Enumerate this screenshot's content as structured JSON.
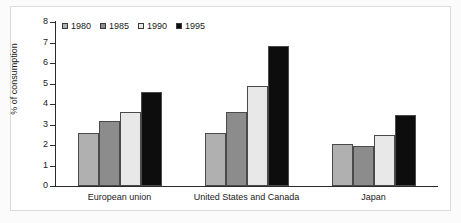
{
  "chart_data": {
    "type": "bar",
    "title": "",
    "xlabel": "",
    "ylabel": "% of consumption",
    "ylim": [
      0,
      8
    ],
    "yticks": [
      0,
      1,
      2,
      3,
      4,
      5,
      6,
      7,
      8
    ],
    "grid": false,
    "legend_position": "top-left",
    "categories": [
      "European union",
      "United States and Canada",
      "Japan"
    ],
    "series": [
      {
        "name": "1980",
        "color": "#b0b0b0",
        "values": [
          2.6,
          2.6,
          2.05
        ]
      },
      {
        "name": "1985",
        "color": "#8c8c8c",
        "values": [
          3.15,
          3.6,
          1.95
        ]
      },
      {
        "name": "1990",
        "color": "#e8e8e8",
        "values": [
          3.6,
          4.9,
          2.5
        ]
      },
      {
        "name": "1995",
        "color": "#0d0d0d",
        "values": [
          4.6,
          6.85,
          3.45
        ]
      }
    ]
  },
  "axis": {
    "tick_labels": [
      "8",
      "7",
      "6",
      "5",
      "4",
      "3",
      "2",
      "1",
      "0"
    ]
  },
  "legend": {
    "items": [
      {
        "label": "1980"
      },
      {
        "label": "1985"
      },
      {
        "label": "1990"
      },
      {
        "label": "1995"
      }
    ]
  }
}
